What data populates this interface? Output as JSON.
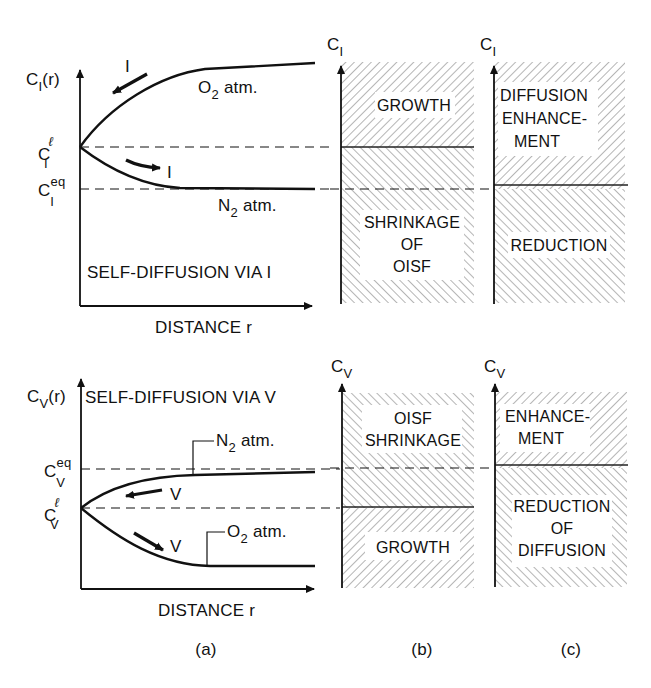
{
  "figure": {
    "panel_labels": {
      "a": "(a)",
      "b": "(b)",
      "c": "(c)"
    },
    "colors": {
      "ink": "#111111",
      "hatch": "#777777",
      "background": "#ffffff"
    }
  },
  "top": {
    "plot_a": {
      "ylabel_main": "C",
      "ylabel_sub": "I",
      "ylabel_suffix": "(r)",
      "xlabel": "DISTANCE r",
      "level_l_main": "C",
      "level_l_sup": "ℓ",
      "level_l_sub": "I",
      "level_eq_main": "C",
      "level_eq_sup": "eq",
      "level_eq_sub": "I",
      "curve_upper_label": "O",
      "curve_upper_label_sub": "2",
      "curve_upper_label_suffix": "atm.",
      "curve_lower_label": "N",
      "curve_lower_label_sub": "2",
      "curve_lower_label_suffix": "atm.",
      "arrow_upper_label": "I",
      "arrow_lower_label": "I",
      "caption": "SELF-DIFFUSION VIA I"
    },
    "plot_b": {
      "axis_main": "C",
      "axis_sub": "I",
      "region_upper": [
        "GROWTH"
      ],
      "region_lower": [
        "SHRINKAGE",
        "OF",
        "OISF"
      ]
    },
    "plot_c": {
      "axis_main": "C",
      "axis_sub": "I",
      "region_upper": [
        "DIFFUSION",
        "ENHANCE-",
        "MENT"
      ],
      "region_lower": [
        "REDUCTION"
      ]
    }
  },
  "bottom": {
    "plot_a": {
      "ylabel_main": "C",
      "ylabel_sub": "V",
      "ylabel_suffix": "(r)",
      "xlabel": "DISTANCE r",
      "level_eq_main": "C",
      "level_eq_sup": "eq",
      "level_eq_sub": "V",
      "level_l_main": "C",
      "level_l_sup": "ℓ",
      "level_l_sub": "V",
      "curve_upper_label": "N",
      "curve_upper_label_sub": "2",
      "curve_upper_label_suffix": "atm.",
      "curve_lower_label": "O",
      "curve_lower_label_sub": "2",
      "curve_lower_label_suffix": "atm.",
      "arrow_upper_label": "V",
      "arrow_lower_label": "V",
      "caption": "SELF-DIFFUSION VIA V"
    },
    "plot_b": {
      "axis_main": "C",
      "axis_sub": "V",
      "region_upper": [
        "OISF",
        "SHRINKAGE"
      ],
      "region_lower": [
        "GROWTH"
      ]
    },
    "plot_c": {
      "axis_main": "C",
      "axis_sub": "V",
      "region_upper": [
        "ENHANCE-",
        "MENT"
      ],
      "region_lower": [
        "REDUCTION",
        "OF",
        "DIFFUSION"
      ]
    }
  }
}
